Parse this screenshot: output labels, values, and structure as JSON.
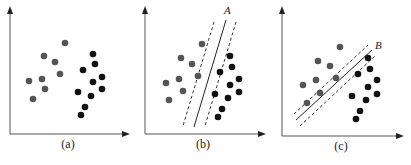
{
  "figure": {
    "panels": [
      {
        "id": "a",
        "caption": "(a)",
        "line_label": "",
        "gray_points": [
          [
            65,
            43
          ],
          [
            44,
            56
          ],
          [
            55,
            62
          ],
          [
            60,
            74
          ],
          [
            42,
            79
          ],
          [
            29,
            81
          ],
          [
            45,
            89
          ],
          [
            33,
            99
          ]
        ],
        "black_points": [
          [
            93,
            54
          ],
          [
            95,
            64
          ],
          [
            83,
            70
          ],
          [
            102,
            77
          ],
          [
            93,
            82
          ],
          [
            78,
            92
          ],
          [
            102,
            89
          ],
          [
            91,
            96
          ],
          [
            85,
            107
          ],
          [
            81,
            115
          ]
        ]
      },
      {
        "id": "b",
        "caption": "(b)",
        "line_label": "A",
        "gray_points": [
          [
            202,
            44
          ],
          [
            181,
            58
          ],
          [
            192,
            64
          ],
          [
            198,
            76
          ],
          [
            179,
            79
          ],
          [
            166,
            83
          ],
          [
            183,
            91
          ],
          [
            169,
            100
          ]
        ],
        "black_points": [
          [
            230,
            56
          ],
          [
            232,
            67
          ],
          [
            220,
            72
          ],
          [
            239,
            79
          ],
          [
            230,
            85
          ],
          [
            215,
            94
          ],
          [
            239,
            92
          ],
          [
            228,
            98
          ],
          [
            222,
            109
          ],
          [
            218,
            117
          ]
        ],
        "separator": {
          "solid": [
            [
              226,
              20
            ],
            [
              194,
              127
            ]
          ],
          "dash1": [
            [
              214,
              22
            ],
            [
              183,
              126
            ]
          ],
          "dash2": [
            [
              236,
              22
            ],
            [
              205,
              126
            ]
          ]
        }
      },
      {
        "id": "c",
        "caption": "(c)",
        "line_label": "B",
        "gray_points": [
          [
            340,
            47
          ],
          [
            318,
            61
          ],
          [
            330,
            66
          ],
          [
            336,
            78
          ],
          [
            316,
            80
          ],
          [
            303,
            85
          ],
          [
            320,
            93
          ],
          [
            307,
            103
          ]
        ],
        "black_points": [
          [
            368,
            58
          ],
          [
            370,
            69
          ],
          [
            358,
            74
          ],
          [
            377,
            80
          ],
          [
            368,
            87
          ],
          [
            352,
            96
          ],
          [
            377,
            94
          ],
          [
            366,
            100
          ],
          [
            360,
            111
          ],
          [
            356,
            119
          ]
        ],
        "separator": {
          "solid": [
            [
              296,
              120
            ],
            [
              372,
              50
            ]
          ],
          "dash1": [
            [
              294,
              114
            ],
            [
              368,
              45
            ]
          ],
          "dash2": [
            [
              300,
              126
            ],
            [
              376,
              55
            ]
          ]
        }
      }
    ],
    "colors": {
      "gray_class": "#555555",
      "black_class": "#111111",
      "axis": "#555555"
    }
  }
}
